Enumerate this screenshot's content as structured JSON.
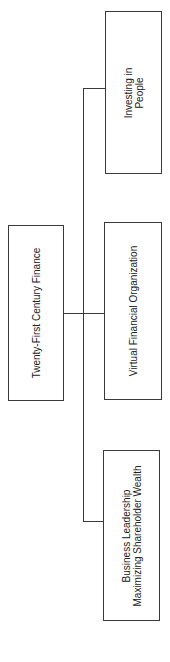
{
  "diagram": {
    "type": "org-chart",
    "orientation": "rotated-90-ccw",
    "root": {
      "label": "Twenty-First Century Finance"
    },
    "children": [
      {
        "label_lines": [
          "Investing in",
          "People"
        ]
      },
      {
        "label_lines": [
          "Virtual Financial Organization"
        ]
      },
      {
        "label_lines": [
          "Business Leadership",
          "Maximizing Shareholder Wealth"
        ]
      }
    ],
    "colors": {
      "stroke": "#3a3a3a",
      "text": "#222222",
      "background": "#ffffff"
    }
  }
}
